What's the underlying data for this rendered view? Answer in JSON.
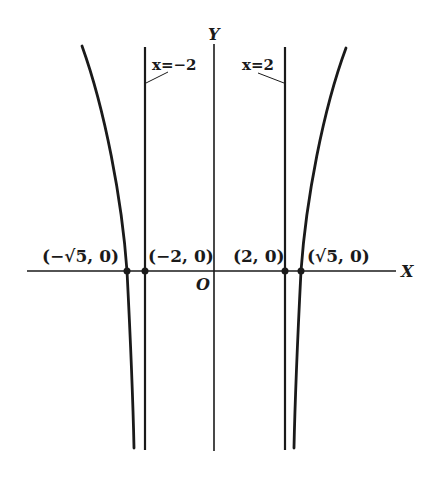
{
  "figure": {
    "axes": {
      "x_label": "X",
      "y_label": "Y",
      "origin_label": "O"
    },
    "asymptotes": [
      {
        "label": "x=−2",
        "x": -2
      },
      {
        "label": "x=2",
        "x": 2
      }
    ],
    "points": [
      {
        "label": "(−√5, 0)",
        "x": -2.236,
        "y": 0
      },
      {
        "label": "(−2, 0)",
        "x": -2,
        "y": 0
      },
      {
        "label": "(2, 0)",
        "x": 2,
        "y": 0
      },
      {
        "label": "(√5, 0)",
        "x": 2.236,
        "y": 0
      }
    ],
    "colors": {
      "ink": "#1a1a1a",
      "background": "#ffffff"
    }
  }
}
